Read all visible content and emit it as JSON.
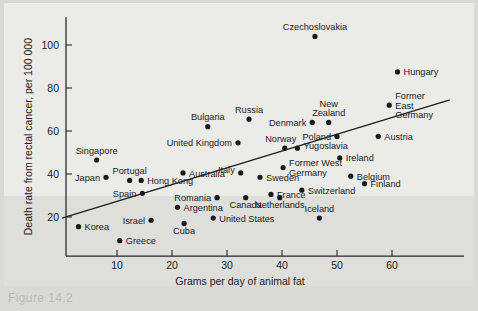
{
  "figure": {
    "caption": "Figure 14.2"
  },
  "chart_data": {
    "type": "scatter",
    "title": "",
    "xlabel": "Grams per day of animal fat",
    "ylabel": "Death rate from rectal cancer, per 100 000",
    "xlim": [
      0,
      72
    ],
    "ylim": [
      0,
      112
    ],
    "xticks": [
      10,
      20,
      30,
      40,
      50,
      60
    ],
    "yticks": [
      20,
      40,
      60,
      80,
      100
    ],
    "grid": false,
    "legend": "none",
    "regression_line": {
      "label": "least-squares line",
      "x_start": 0,
      "y_start": 19.5,
      "x_end": 70.5,
      "y_end": 74.5
    },
    "points": [
      {
        "label": "Korea",
        "x": 3.0,
        "y": 15.5,
        "label_dx": 6,
        "label_dy": 3.6,
        "anchor": "start"
      },
      {
        "label": "Japan",
        "x": 8.0,
        "y": 38.5,
        "label_dx": -6,
        "label_dy": 3.6,
        "anchor": "end"
      },
      {
        "label": "Singapore",
        "x": 6.3,
        "y": 46.5,
        "label_dx": 0,
        "label_dy": -6.5,
        "anchor": "middle"
      },
      {
        "label": "Greece",
        "x": 10.5,
        "y": 9.0,
        "label_dx": 6,
        "label_dy": 3.6,
        "anchor": "start"
      },
      {
        "label": "Portugal",
        "x": 12.3,
        "y": 37.0,
        "label_dx": 0,
        "label_dy": -6.5,
        "anchor": "middle"
      },
      {
        "label": "Hong Kong",
        "x": 14.4,
        "y": 37.0,
        "label_dx": 6,
        "label_dy": 3.6,
        "anchor": "start"
      },
      {
        "label": "Spain",
        "x": 14.6,
        "y": 31.0,
        "label_dx": -6,
        "label_dy": 3.6,
        "anchor": "end"
      },
      {
        "label": "Israel",
        "x": 16.2,
        "y": 18.5,
        "label_dx": -6,
        "label_dy": 3.6,
        "anchor": "end"
      },
      {
        "label": "Argentina",
        "x": 21.0,
        "y": 24.5,
        "label_dx": 6,
        "label_dy": 3.6,
        "anchor": "start"
      },
      {
        "label": "Cuba",
        "x": 22.2,
        "y": 17.0,
        "label_dx": 0,
        "label_dy": 10.5,
        "anchor": "middle"
      },
      {
        "label": "Australia",
        "x": 22.0,
        "y": 40.5,
        "label_dx": 6,
        "label_dy": 3.6,
        "anchor": "start"
      },
      {
        "label": "Bulgaria",
        "x": 26.5,
        "y": 62.0,
        "label_dx": 0,
        "label_dy": -6.5,
        "anchor": "middle"
      },
      {
        "label": "United States",
        "x": 27.5,
        "y": 19.5,
        "label_dx": 6,
        "label_dy": 3.6,
        "anchor": "start"
      },
      {
        "label": "Romania",
        "x": 28.2,
        "y": 29.0,
        "label_dx": -6,
        "label_dy": 3.6,
        "anchor": "end"
      },
      {
        "label": "Italy",
        "x": 32.5,
        "y": 40.5,
        "label_dx": -6,
        "label_dy": 0.5,
        "anchor": "end"
      },
      {
        "label": "United Kingdom",
        "x": 32.0,
        "y": 54.5,
        "label_dx": -6,
        "label_dy": 3.6,
        "anchor": "end"
      },
      {
        "label": "Canada",
        "x": 33.4,
        "y": 29.0,
        "label_dx": 0,
        "label_dy": 10.5,
        "anchor": "middle"
      },
      {
        "label": "Russia",
        "x": 34.0,
        "y": 65.5,
        "label_dx": 0,
        "label_dy": -6.5,
        "anchor": "middle"
      },
      {
        "label": "Sweden",
        "x": 36.0,
        "y": 38.5,
        "label_dx": 6,
        "label_dy": 3.6,
        "anchor": "start"
      },
      {
        "label": "France",
        "x": 38.0,
        "y": 30.5,
        "label_dx": 6,
        "label_dy": 3.6,
        "anchor": "start"
      },
      {
        "label": "Netherlands",
        "x": 39.6,
        "y": 29.0,
        "label_dx": 0,
        "label_dy": 10.5,
        "anchor": "middle"
      },
      {
        "label": "Norway",
        "x": 40.5,
        "y": 52.0,
        "label_dx": -4,
        "label_dy": -6.5,
        "anchor": "middle"
      },
      {
        "label": "Former West Germany",
        "x": 40.2,
        "y": 43.0,
        "label_dx": 6,
        "label_dy": 3.6,
        "anchor": "start"
      },
      {
        "label": "Yugoslavia",
        "x": 42.8,
        "y": 52.0,
        "label_dx": 6,
        "label_dy": 1.0,
        "anchor": "start"
      },
      {
        "label": "Switzerland",
        "x": 43.6,
        "y": 32.5,
        "label_dx": 6,
        "label_dy": 3.6,
        "anchor": "start"
      },
      {
        "label": "Denmark",
        "x": 45.5,
        "y": 64.0,
        "label_dx": -6,
        "label_dy": 3.6,
        "anchor": "end"
      },
      {
        "label": "Czechoslovakia",
        "x": 46.0,
        "y": 104.0,
        "label_dx": 0,
        "label_dy": -6.5,
        "anchor": "middle"
      },
      {
        "label": "Iceland",
        "x": 46.8,
        "y": 19.5,
        "label_dx": 0,
        "label_dy": -6.5,
        "anchor": "middle"
      },
      {
        "label": "New Zealand",
        "x": 48.5,
        "y": 64.0,
        "label_dx": 0,
        "label_dy": -6.5,
        "anchor": "middle"
      },
      {
        "label": "Poland",
        "x": 50.0,
        "y": 57.5,
        "label_dx": -6,
        "label_dy": 3.6,
        "anchor": "end"
      },
      {
        "label": "Ireland",
        "x": 50.5,
        "y": 47.5,
        "label_dx": 6,
        "label_dy": 3.6,
        "anchor": "start"
      },
      {
        "label": "Belgium",
        "x": 52.5,
        "y": 39.0,
        "label_dx": 6,
        "label_dy": 3.6,
        "anchor": "start"
      },
      {
        "label": "Finland",
        "x": 55.0,
        "y": 35.5,
        "label_dx": 6,
        "label_dy": 3.6,
        "anchor": "start"
      },
      {
        "label": "Austria",
        "x": 57.5,
        "y": 57.5,
        "label_dx": 6,
        "label_dy": 3.6,
        "anchor": "start"
      },
      {
        "label": "Former East Germany",
        "x": 59.5,
        "y": 72.0,
        "label_dx": 6,
        "label_dy": 3.6,
        "anchor": "start"
      },
      {
        "label": "Hungary",
        "x": 61.0,
        "y": 87.5,
        "label_dx": 6,
        "label_dy": 3.6,
        "anchor": "start"
      }
    ]
  }
}
